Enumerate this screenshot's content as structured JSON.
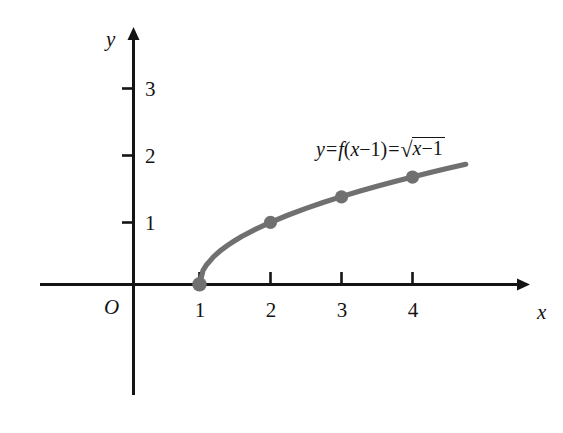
{
  "figure": {
    "background_color": "#ffffff",
    "width": 563,
    "height": 433
  },
  "axes": {
    "x_axis_label": "x",
    "y_axis_label": "y",
    "origin_label": "O",
    "axis_color": "#141414",
    "x_tick_labels": [
      "1",
      "2",
      "3",
      "4"
    ],
    "y_tick_labels": [
      "1",
      "2",
      "3"
    ]
  },
  "equation": {
    "lhs": "y",
    "eq1": "=",
    "func": "f",
    "open_paren": "(",
    "func_arg_var": "x",
    "minus1": "−1",
    "close_paren": ")",
    "eq2": "=",
    "radical_sign": "√",
    "radicand_var": "x",
    "radicand_minus": "−1",
    "plain_text": "y = f(x−1) = √(x−1)"
  },
  "chart_data": {
    "type": "line",
    "title": "",
    "subtitle": "",
    "xlabel": "x",
    "ylabel": "y",
    "function": "y = f(x-1) = sqrt(x-1)",
    "curve_color": "#707070",
    "point_color": "#707070",
    "grid": false,
    "legend_position": "none",
    "xlim": [
      -1.3,
      5.55
    ],
    "ylim": [
      -1.8,
      4.15
    ],
    "xticks": [
      1,
      2,
      3,
      4
    ],
    "yticks": [
      1,
      2,
      3
    ],
    "annotations": [
      {
        "text": "y = f(x−1) = √(x−1)",
        "x": 3.6,
        "y": 2.15
      }
    ],
    "marked_points": [
      {
        "x": 1,
        "y": 0,
        "label": "(1, 0)"
      },
      {
        "x": 2,
        "y": 1,
        "label": "(2, 1)"
      },
      {
        "x": 3,
        "y": 1.41,
        "label": "(3, 1.41)"
      },
      {
        "x": 4,
        "y": 1.73,
        "label": "(4, 1.73)"
      }
    ],
    "x": [
      1,
      1.05,
      1.1,
      1.2,
      1.3,
      1.4,
      1.5,
      1.6,
      1.8,
      2,
      2.25,
      2.5,
      2.75,
      3,
      3.25,
      3.5,
      3.75,
      4,
      4.25,
      4.5,
      4.75
    ],
    "y": [
      0,
      0.224,
      0.316,
      0.447,
      0.548,
      0.632,
      0.707,
      0.775,
      0.894,
      1,
      1.118,
      1.225,
      1.323,
      1.414,
      1.5,
      1.581,
      1.658,
      1.732,
      1.803,
      1.871,
      1.936
    ]
  }
}
